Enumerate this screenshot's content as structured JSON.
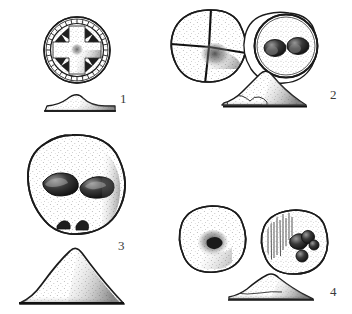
{
  "plate": {
    "kind": "archaeological-line-drawing",
    "background_color": "#ffffff",
    "ink_color": "#1c1c1c",
    "stipple_color": "#4a4a4a",
    "width": 352,
    "height": 314,
    "caption_font_color": "#3a3a3a"
  },
  "figures": [
    {
      "number": "1",
      "label": "1",
      "number_position": {
        "x": 120,
        "y": 92
      },
      "views": [
        {
          "view_type": "plan",
          "description": "circular disc with hatched outer border band and radiating spoke-and-cross (wheel) motif",
          "center": {
            "x": 77,
            "y": 50
          },
          "radius": 33,
          "motif": "cross-and-spokes",
          "spoke_count": 8,
          "rim_band": true
        },
        {
          "view_type": "profile",
          "description": "low flattened dome with wide flat base",
          "center": {
            "x": 81,
            "y": 99
          },
          "width": 68,
          "height": 14,
          "profile_shape": "low-dome"
        }
      ]
    },
    {
      "number": "2",
      "label": "2",
      "number_position": {
        "x": 330,
        "y": 88
      },
      "views": [
        {
          "view_type": "plan-obverse",
          "description": "irregular round disc divided into four quadrants by two incised grooves, dark shading in lower-right quadrant near centre",
          "center": {
            "x": 208,
            "y": 46
          },
          "radius": 36,
          "motif": "incised-cross-quadrants",
          "shaded_quadrant": "lower-right"
        },
        {
          "view_type": "plan-reverse",
          "description": "round disc with raised double rim and two dark oval depressions side by side",
          "center": {
            "x": 286,
            "y": 45
          },
          "radius": 34,
          "motif": "two-oval-depressions",
          "depression_count": 2,
          "double_rim": true
        },
        {
          "view_type": "profile",
          "description": "rounded conical mound with flat base, apex right of centre",
          "center": {
            "x": 265,
            "y": 92
          },
          "width": 82,
          "height": 26,
          "profile_shape": "rounded-cone"
        }
      ]
    },
    {
      "number": "3",
      "label": "3",
      "number_position": {
        "x": 118,
        "y": 239
      },
      "views": [
        {
          "view_type": "plan",
          "description": "large round stippled object with two dark almond-shaped depressions and two small notches on the lower edge",
          "center": {
            "x": 72,
            "y": 186
          },
          "radius": 51,
          "motif": "two-almond-depressions",
          "depression_count": 2,
          "basal_notches": 2
        },
        {
          "view_type": "profile",
          "description": "tall conical section with flat base",
          "center": {
            "x": 70,
            "y": 283
          },
          "width": 104,
          "height": 44,
          "profile_shape": "tall-cone"
        }
      ]
    },
    {
      "number": "4",
      "label": "4",
      "number_position": {
        "x": 330,
        "y": 285
      },
      "views": [
        {
          "view_type": "plan-obverse",
          "description": "round stippled disc with a single dark irregular pit at the centre",
          "center": {
            "x": 212,
            "y": 239
          },
          "radius": 33,
          "motif": "central-pit",
          "depression_count": 1
        },
        {
          "view_type": "plan-reverse",
          "description": "round disc with vertical striations on the left half and four dark round pits on the right half",
          "center": {
            "x": 295,
            "y": 241
          },
          "radius": 32,
          "motif": "striations-and-pits",
          "depression_count": 4,
          "striation_count": 9
        },
        {
          "view_type": "profile",
          "description": "low asymmetric wedge with flat base and apex left of centre",
          "center": {
            "x": 268,
            "y": 290
          },
          "width": 82,
          "height": 18,
          "profile_shape": "low-wedge"
        }
      ]
    }
  ]
}
